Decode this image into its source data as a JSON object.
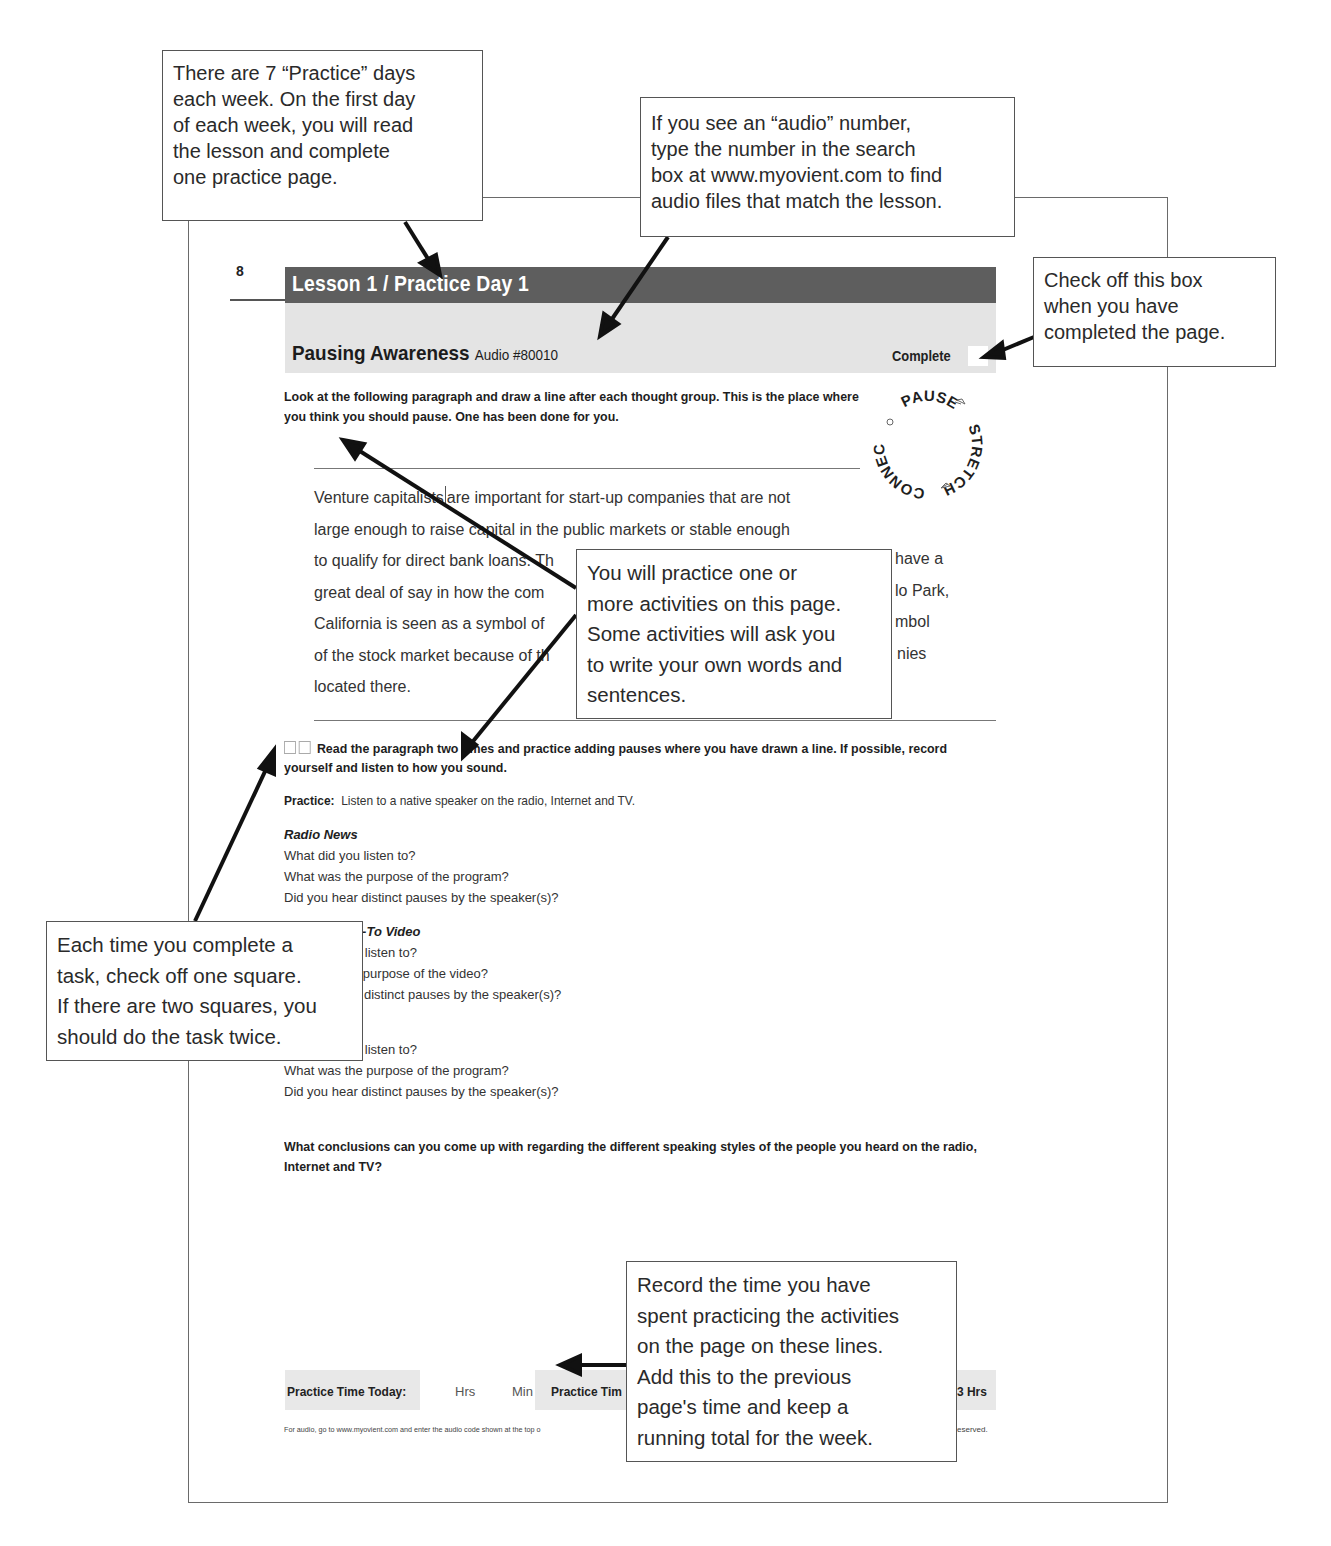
{
  "page": {
    "number": "8",
    "lesson_title": "Lesson 1 / Practice Day 1",
    "activity_title": "Pausing Awareness",
    "audio_code": "Audio #80010",
    "complete_label": "Complete",
    "instructions": "Look at the following paragraph and draw a line after each thought group. This is the place where you think you should pause. One has been done for you.",
    "logo": {
      "words": [
        "PAUSE",
        "STRETCH",
        "CONNECT"
      ]
    },
    "paragraph_lines": [
      {
        "before": "Venture capitalists",
        "after": "are important for start-up companies that are not"
      },
      {
        "text": "large enough to raise capital in the public markets or stable enough"
      },
      {
        "text": "to qualify for direct bank loans. Th",
        "tail": "have a"
      },
      {
        "text": "great deal of say in how the com",
        "tail": "lo Park,"
      },
      {
        "text": "California is seen as a symbol of",
        "tail": "mbol"
      },
      {
        "text": "of the stock market because of th",
        "tail": "nies"
      },
      {
        "text": "located there."
      }
    ],
    "task": {
      "checkbox_count": 2,
      "text": "Read the paragraph two times and practice adding pauses where you have drawn a line. If possible, record yourself and listen to how you sound."
    },
    "practice": {
      "label": "Practice:",
      "text": "Listen to a native speaker on the radio, Internet and TV."
    },
    "sections": [
      {
        "heading": "Radio News",
        "questions": [
          "What did you listen to?",
          "What was the purpose of the program?",
          "Did you hear distinct pauses by the speaker(s)?"
        ]
      },
      {
        "heading": "w-To Video",
        "questions": [
          "u listen to?",
          "e purpose of the video?",
          "r distinct pauses by the speaker(s)?"
        ]
      },
      {
        "heading": "",
        "questions": [
          "u listen to?",
          "What was the purpose of the program?",
          "Did you hear distinct pauses by the speaker(s)?"
        ]
      }
    ],
    "conclusion": "What conclusions can you come up with regarding the different speaking styles of the people you heard on the radio, Internet and TV?",
    "time_row": {
      "today_label": "Practice Time Today:",
      "hrs_label": "Hrs",
      "min_label": "Min",
      "total_label": "Practice Tim",
      "goal_label": "3 Hrs"
    },
    "footer": {
      "note": "For audio, go to www.myovient.com and enter the audio code shown at the top o",
      "rights": "eserved."
    }
  },
  "callouts": {
    "practice_days": [
      "There are 7 “Practice” days",
      "each week. On the first day",
      "of each week, you will read",
      "the lesson and complete",
      "one practice page."
    ],
    "audio_number": [
      "If you see an “audio” number,",
      "type the number in the search",
      "box at www.myovient.com to find",
      "audio files that match the lesson."
    ],
    "check_box": [
      "Check off this box",
      "when you have",
      "completed the page."
    ],
    "activities": [
      "You will practice one or",
      "more activities on this page.",
      "Some activities will ask you",
      "to write your own words and",
      "sentences."
    ],
    "squares": [
      "Each time you complete a",
      "task, check off one square.",
      "If there are two squares, you",
      "should do the task twice."
    ],
    "time": [
      "Record the time you have",
      "spent practicing the activities",
      "on the page on these lines.",
      "Add this to the previous",
      "page's time and keep a",
      "running total for the week."
    ]
  }
}
